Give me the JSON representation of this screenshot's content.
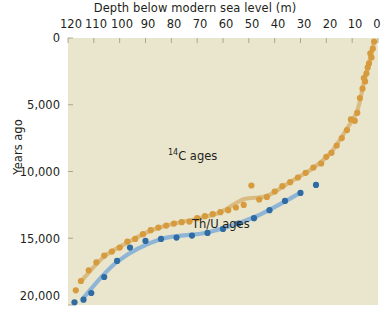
{
  "chart_data": {
    "type": "scatter",
    "title": "",
    "xlabel": "Depth below modern sea level (m)",
    "ylabel": "Years ago",
    "xlim": [
      120,
      0
    ],
    "ylim": [
      20000,
      0
    ],
    "x_inverted": true,
    "y_inverted": true,
    "grid": false,
    "legend_position": "inline-annotations",
    "xticks": [
      120,
      110,
      100,
      90,
      80,
      70,
      60,
      50,
      40,
      30,
      20,
      10,
      0
    ],
    "xticklabels": [
      "120",
      "110",
      "100",
      "90",
      "80",
      "70",
      "60",
      "50",
      "40",
      "30",
      "20",
      "10",
      "0"
    ],
    "yticks": [
      0,
      5000,
      10000,
      15000,
      20000
    ],
    "yticklabels": [
      "0",
      "5,000",
      "10,000",
      "15,000",
      "20,000"
    ],
    "plot_background": "#e9e6cd",
    "series": [
      {
        "name": "14C ages",
        "label_html": "<sup>14</sup>C ages",
        "color": "#d79a3c",
        "line_color": "#d9b97e",
        "points": [
          [
            1.5,
            260
          ],
          [
            2.0,
            800
          ],
          [
            2.5,
            1450
          ],
          [
            3.0,
            1150
          ],
          [
            3.5,
            1900
          ],
          [
            4.0,
            2200
          ],
          [
            4.5,
            2650
          ],
          [
            5.0,
            3250
          ],
          [
            5.5,
            3000
          ],
          [
            6.0,
            3800
          ],
          [
            7.0,
            4500
          ],
          [
            8.0,
            5600
          ],
          [
            9.0,
            6200
          ],
          [
            10.5,
            6100
          ],
          [
            12.0,
            6900
          ],
          [
            14.0,
            7500
          ],
          [
            16.0,
            8050
          ],
          [
            18.0,
            8600
          ],
          [
            20.0,
            8900
          ],
          [
            22.0,
            9400
          ],
          [
            25.0,
            9700
          ],
          [
            28.0,
            10100
          ],
          [
            31.0,
            10450
          ],
          [
            34.0,
            10800
          ],
          [
            37.0,
            11100
          ],
          [
            40.0,
            11500
          ],
          [
            43.0,
            11900
          ],
          [
            46.0,
            12100
          ],
          [
            49.0,
            11050
          ],
          [
            52.0,
            12500
          ],
          [
            55.0,
            12700
          ],
          [
            58.0,
            12900
          ],
          [
            61.0,
            13050
          ],
          [
            64.0,
            13200
          ],
          [
            67.0,
            13350
          ],
          [
            70.0,
            13500
          ],
          [
            73.0,
            13750
          ],
          [
            76.0,
            13800
          ],
          [
            79.0,
            13900
          ],
          [
            82.0,
            14050
          ],
          [
            85.0,
            14200
          ],
          [
            88.0,
            14400
          ],
          [
            91.0,
            14700
          ],
          [
            94.0,
            15050
          ],
          [
            97.0,
            15250
          ],
          [
            100.0,
            15700
          ],
          [
            103.0,
            16000
          ],
          [
            106.0,
            16300
          ],
          [
            109.0,
            16800
          ],
          [
            112.0,
            17400
          ],
          [
            115.0,
            18200
          ],
          [
            117.0,
            18900
          ]
        ]
      },
      {
        "name": "Th/U ages",
        "label_html": "Th/U ages",
        "color": "#2e6ca3",
        "line_color": "#8ab2d6",
        "points": [
          [
            24.0,
            11000
          ],
          [
            30.0,
            11600
          ],
          [
            36.0,
            12200
          ],
          [
            42.0,
            12900
          ],
          [
            48.0,
            13500
          ],
          [
            54.0,
            13900
          ],
          [
            60.0,
            14300
          ],
          [
            66.0,
            14600
          ],
          [
            72.0,
            14800
          ],
          [
            78.0,
            14950
          ],
          [
            84.0,
            15050
          ],
          [
            90.0,
            15200
          ],
          [
            96.0,
            15700
          ],
          [
            101.0,
            16700
          ],
          [
            106.0,
            17900
          ],
          [
            111.0,
            19100
          ],
          [
            114.0,
            19600
          ],
          [
            117.5,
            19800
          ]
        ]
      }
    ],
    "annotations": [
      {
        "text": "14C ages",
        "series": "14C ages"
      },
      {
        "text": "Th/U ages",
        "series": "Th/U ages"
      }
    ]
  },
  "axes": {
    "xtitle": "Depth below modern sea level (m)",
    "ytitle": "Years ago",
    "xticklabels": [
      "120",
      "110",
      "100",
      "90",
      "80",
      "70",
      "60",
      "50",
      "40",
      "30",
      "20",
      "10",
      "0"
    ],
    "yticklabels": [
      "0",
      "5,000",
      "10,000",
      "15,000",
      "20,000"
    ]
  },
  "labels": {
    "c14_sup": "14",
    "c14_rest": "C ages",
    "thu": "Th/U ages"
  },
  "colors": {
    "orange_point": "#d79a3c",
    "orange_line": "#dbbb80",
    "blue_point": "#2e6ca3",
    "blue_line": "#8ab2d6",
    "plot_bg": "#e9e6cd",
    "text": "#231f20"
  }
}
